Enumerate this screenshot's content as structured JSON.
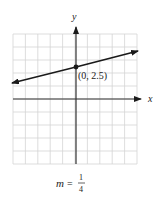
{
  "chart_data": {
    "type": "line",
    "title": "",
    "xlabel": "x",
    "ylabel": "y",
    "xlim": [
      -5,
      5
    ],
    "ylim": [
      -5,
      5
    ],
    "grid": true,
    "tick_labels": false,
    "series": [
      {
        "name": "line",
        "slope": 0.25,
        "intercept": 2.5,
        "x": [
          -5,
          0,
          5
        ],
        "y": [
          1.25,
          2.5,
          3.75
        ],
        "arrows_both_ends": true
      }
    ],
    "points": [
      {
        "x": 0,
        "y": 2.5,
        "label": "(0, 2.5)"
      }
    ],
    "annotations": [
      {
        "text": "m = 1/4",
        "position": "below chart"
      }
    ]
  },
  "labels": {
    "x_axis": "x",
    "y_axis": "y",
    "point": "(0, 2.5)",
    "slope_var": "m",
    "slope_eq": "=",
    "slope_num": "1",
    "slope_den": "4"
  },
  "colors": {
    "grid": "#d4d4d4",
    "axis": "#333333",
    "line": "#1a1a1a"
  }
}
